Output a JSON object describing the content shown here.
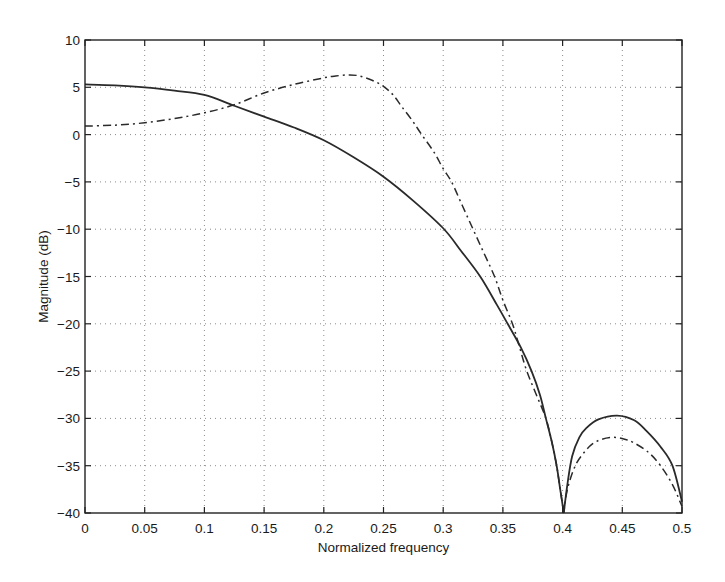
{
  "chart_data": {
    "type": "line",
    "title": "",
    "xlabel": "Normalized frequency",
    "ylabel": "Magnitude (dB)",
    "xlim": [
      0,
      0.5
    ],
    "ylim": [
      -40,
      10
    ],
    "grid": true,
    "legend": null,
    "xticks": [
      0,
      0.05,
      0.1,
      0.15,
      0.2,
      0.25,
      0.3,
      0.35,
      0.4,
      0.45,
      0.5
    ],
    "xtick_labels": [
      "0",
      "0.05",
      "0.1",
      "0.15",
      "0.2",
      "0.25",
      "0.3",
      "0.35",
      "0.4",
      "0.45",
      "0.5"
    ],
    "yticks": [
      10,
      5,
      0,
      -5,
      -10,
      -15,
      -20,
      -25,
      -30,
      -35,
      -40
    ],
    "ytick_labels": [
      "10",
      "5",
      "0",
      "-5",
      "-10",
      "-15",
      "-20",
      "-25",
      "-30",
      "-35",
      "-40"
    ],
    "series": [
      {
        "name": "solid",
        "style": "solid",
        "color": "#2a2a2a",
        "x": [
          0,
          0.025,
          0.05,
          0.075,
          0.1,
          0.125,
          0.15,
          0.175,
          0.2,
          0.225,
          0.25,
          0.275,
          0.3,
          0.315,
          0.331,
          0.345,
          0.354,
          0.365,
          0.374,
          0.381,
          0.386,
          0.391,
          0.395,
          0.398,
          0.401,
          0.404,
          0.408,
          0.414,
          0.42,
          0.43,
          0.4457,
          0.46,
          0.47,
          0.482,
          0.492,
          0.5
        ],
        "y": [
          5.3,
          5.2,
          5.0,
          4.65,
          4.2,
          3.05,
          1.9,
          0.75,
          -0.6,
          -2.4,
          -4.45,
          -7.0,
          -9.9,
          -12.3,
          -15.0,
          -18.0,
          -20.0,
          -22.5,
          -25.0,
          -27.5,
          -30.0,
          -32.5,
          -35.0,
          -37.5,
          -40.0,
          -37.0,
          -34.0,
          -32.0,
          -31.0,
          -30.1,
          -29.7,
          -30.2,
          -31.3,
          -33.0,
          -35.0,
          -38.8
        ]
      },
      {
        "name": "dash-dot",
        "style": "dashdot",
        "color": "#2a2a2a",
        "x": [
          0,
          0.025,
          0.05,
          0.075,
          0.1,
          0.125,
          0.15,
          0.175,
          0.2,
          0.21,
          0.22,
          0.228,
          0.235,
          0.243,
          0.25,
          0.258,
          0.265,
          0.274,
          0.282,
          0.292,
          0.3,
          0.307,
          0.316,
          0.325,
          0.334,
          0.343,
          0.35,
          0.358,
          0.364,
          0.37,
          0.378,
          0.386,
          0.391,
          0.395,
          0.398,
          0.401,
          0.404,
          0.4106,
          0.418,
          0.425,
          0.433,
          0.443,
          0.452,
          0.46,
          0.472,
          0.482,
          0.492,
          0.5
        ],
        "y": [
          0.9,
          1.0,
          1.25,
          1.7,
          2.3,
          3.15,
          4.4,
          5.3,
          6.0,
          6.2,
          6.3,
          6.25,
          6.0,
          5.6,
          5.1,
          4.2,
          3.0,
          1.5,
          0.0,
          -1.8,
          -3.6,
          -5.0,
          -7.5,
          -10.0,
          -12.5,
          -15.0,
          -17.5,
          -20.0,
          -22.5,
          -25.0,
          -27.5,
          -30.0,
          -32.5,
          -35.0,
          -37.5,
          -40.0,
          -37.5,
          -35.0,
          -33.6,
          -32.7,
          -32.2,
          -32.0,
          -32.2,
          -32.6,
          -33.6,
          -35.0,
          -37.0,
          -39.3
        ]
      }
    ]
  }
}
